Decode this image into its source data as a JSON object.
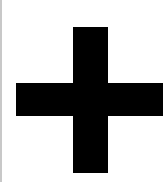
{
  "icon": {
    "name": "plus-icon",
    "glyph": "+",
    "color": "#000000",
    "background": "#ffffff",
    "border_color": "#c8c8c8"
  }
}
